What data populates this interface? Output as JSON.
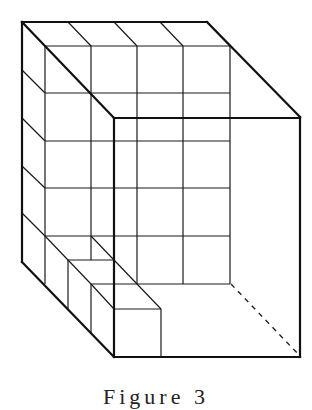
{
  "figure": {
    "caption": "Figure 3",
    "caption_partially_visible": true,
    "grid": {
      "back_wall_columns": 4,
      "back_wall_rows": 5,
      "top_edge_divisions": 4,
      "left_wall_rows": 5
    },
    "small_cubes_count": 3,
    "hidden_edge": "dashed line from back-bottom-right corner to front-bottom-right corner",
    "colors": {
      "line": "#111111",
      "background": "#ffffff"
    }
  }
}
